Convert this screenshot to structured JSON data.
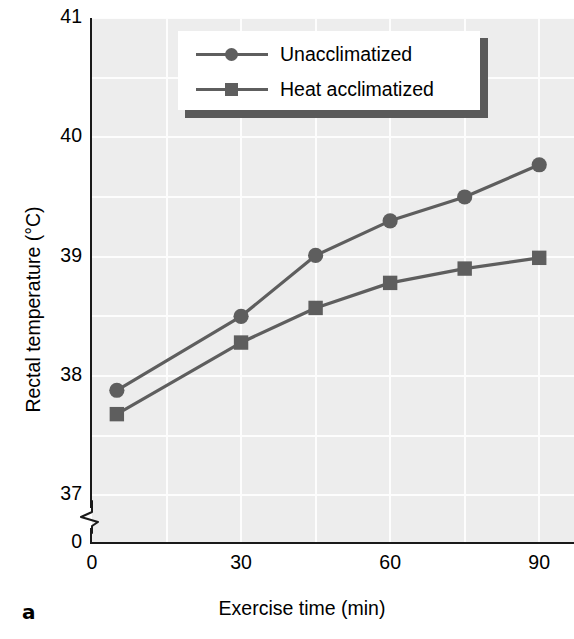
{
  "figure": {
    "panel_letter": "a"
  },
  "chart_data": {
    "type": "line",
    "title": "",
    "xlabel": "Exercise time (min)",
    "ylabel": "Rectal temperature (°C)",
    "x": [
      5,
      30,
      45,
      60,
      75,
      90
    ],
    "xlim": [
      0,
      97
    ],
    "ylim": [
      36.6,
      41
    ],
    "xticks": [
      0,
      30,
      60,
      90
    ],
    "xtick_labels": [
      "0",
      "30",
      "60",
      "90"
    ],
    "yticks": [
      37,
      38,
      39,
      40,
      41
    ],
    "ytick_labels": [
      "37",
      "38",
      "39",
      "40",
      "41"
    ],
    "y_origin_label": "0",
    "y_axis_break": true,
    "grid": true,
    "grid_y_minor_step": 0.5,
    "grid_x_step": 15,
    "legend_position": "top-center",
    "series": [
      {
        "name": "Unacclimatized",
        "marker": "circle",
        "color": "#5e5e5e",
        "values": [
          37.88,
          38.5,
          39.01,
          39.3,
          39.5,
          39.77
        ]
      },
      {
        "name": "Heat acclimatized",
        "marker": "square",
        "color": "#5e5e5e",
        "values": [
          37.68,
          38.28,
          38.57,
          38.78,
          38.9,
          38.99
        ]
      }
    ]
  },
  "colors": {
    "plot_background": "#ededed",
    "gridline": "#fdfdfd",
    "axis": "#1a1a1a",
    "series": "#5e5e5e",
    "legend_shadow": "#5a5a5a",
    "legend_background": "#ffffff"
  }
}
